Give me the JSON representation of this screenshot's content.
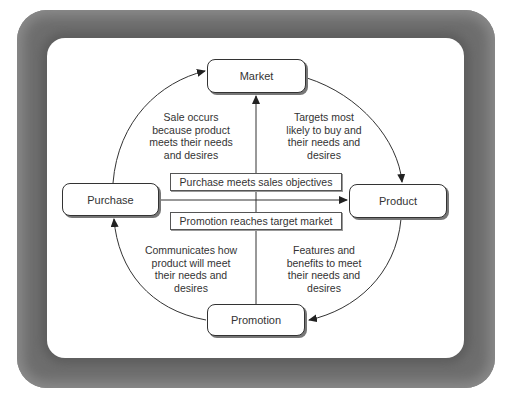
{
  "diagram": {
    "nodes": {
      "market": "Market",
      "product": "Product",
      "promotion": "Promotion",
      "purchase": "Purchase"
    },
    "center_boxes": {
      "top": "Purchase meets sales objectives",
      "bottom": "Promotion reaches target market"
    },
    "edge_labels": {
      "purchase_to_market": [
        "Sale occurs",
        "because product",
        "meets their needs",
        "and desires"
      ],
      "market_to_product": [
        "Targets most",
        "likely to buy and",
        "their needs and",
        "desires"
      ],
      "product_to_promotion": [
        "Features and",
        "benefits to meet",
        "their needs and",
        "desires"
      ],
      "promotion_to_purchase": [
        "Communicates how",
        "product will meet",
        "their needs and",
        "desires"
      ]
    },
    "edges": [
      {
        "from": "Purchase",
        "to": "Market",
        "type": "curved-arrow"
      },
      {
        "from": "Market",
        "to": "Product",
        "type": "curved-arrow"
      },
      {
        "from": "Product",
        "to": "Promotion",
        "type": "curved-arrow"
      },
      {
        "from": "Promotion",
        "to": "Purchase",
        "type": "curved-arrow"
      },
      {
        "from": "Promotion",
        "to": "Market",
        "type": "vertical-arrow"
      },
      {
        "from": "Purchase",
        "to": "Product",
        "type": "horizontal-arrow"
      }
    ],
    "colors": {
      "frame": "#6e6e6e",
      "panel": "#ffffff",
      "line": "#333333",
      "text": "#333333"
    }
  }
}
